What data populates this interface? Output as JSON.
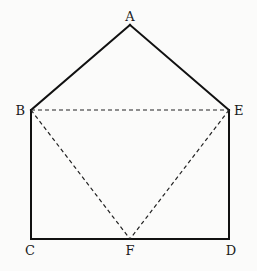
{
  "diagram": {
    "title": "",
    "colors": {
      "background": "#fbfbfa",
      "line": "#111111",
      "dashed": "#222222",
      "label": "#1a1a1a"
    },
    "points": [
      {
        "id": "A",
        "label": "A"
      },
      {
        "id": "B",
        "label": "B"
      },
      {
        "id": "E",
        "label": "E"
      },
      {
        "id": "C",
        "label": "C"
      },
      {
        "id": "F",
        "label": "F"
      },
      {
        "id": "D",
        "label": "D"
      }
    ],
    "solid_segments": [
      [
        "B",
        "A"
      ],
      [
        "A",
        "E"
      ],
      [
        "E",
        "D"
      ],
      [
        "D",
        "C"
      ],
      [
        "C",
        "B"
      ]
    ],
    "dashed_segments": [
      [
        "B",
        "E"
      ],
      [
        "B",
        "F"
      ],
      [
        "E",
        "F"
      ]
    ],
    "relations": {
      "F": "midpoint of CD"
    }
  }
}
